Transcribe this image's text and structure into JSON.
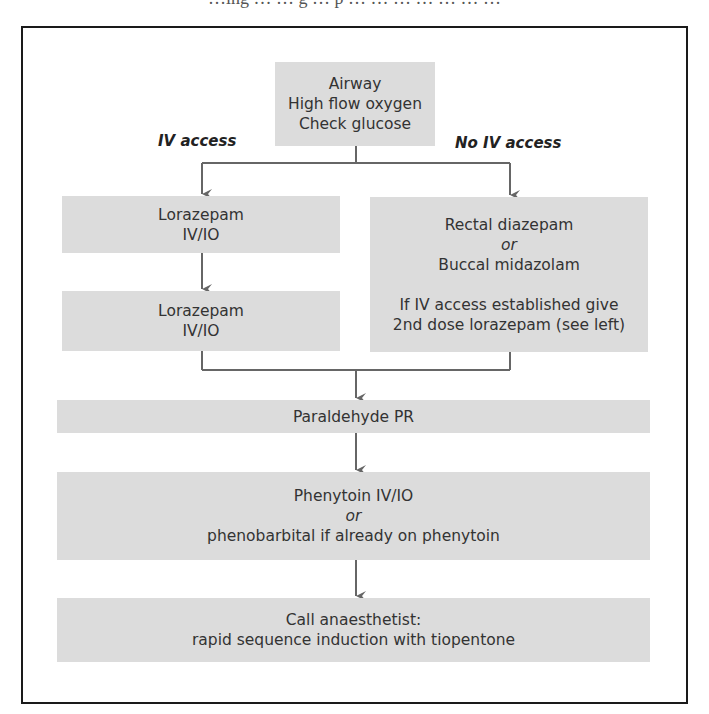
{
  "page": {
    "cropped_top_text": "…ing … … g … p … … … … … … …"
  },
  "flowchart": {
    "colors": {
      "box_fill": "#dcdcdc",
      "text": "#333333",
      "connector": "#666666",
      "frame": "#1a1a1a"
    },
    "start": {
      "lines": [
        "Airway",
        "High flow oxygen",
        "Check glucose"
      ]
    },
    "branch_labels": {
      "left": "IV access",
      "right": "No IV access"
    },
    "left_branch": {
      "step1": {
        "lines": [
          "Lorazepam",
          "IV/IO"
        ]
      },
      "step2": {
        "lines": [
          "Lorazepam",
          "IV/IO"
        ]
      }
    },
    "right_branch": {
      "lines": [
        "Rectal diazepam",
        "or",
        "Buccal midazolam"
      ],
      "note_lines": [
        "If IV access established give",
        "2nd dose lorazepam (see left)"
      ]
    },
    "step_paraldehyde": {
      "lines": [
        "Paraldehyde PR"
      ]
    },
    "step_phenytoin": {
      "lines": [
        "Phenytoin IV/IO",
        "or",
        "phenobarbital if already on phenytoin"
      ]
    },
    "step_anaesthetist": {
      "lines": [
        "Call anaesthetist:",
        "rapid sequence induction with tiopentone"
      ]
    }
  }
}
